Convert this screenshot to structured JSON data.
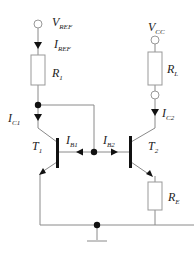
{
  "diagram": {
    "labels": {
      "vref": {
        "main": "V",
        "sub": "REF"
      },
      "iref": {
        "main": "I",
        "sub": "REF"
      },
      "r1": {
        "main": "R",
        "sub": "1"
      },
      "ic1": {
        "main": "I",
        "sub": "C1"
      },
      "ib1": {
        "main": "I",
        "sub": "B1"
      },
      "ib2": {
        "main": "I",
        "sub": "B2"
      },
      "t1": {
        "main": "T",
        "sub": "1"
      },
      "t2": {
        "main": "T",
        "sub": "2"
      },
      "vcc": {
        "main": "V",
        "sub": "CC"
      },
      "rl": {
        "main": "R",
        "sub": "L"
      },
      "ic2": {
        "main": "I",
        "sub": "C2"
      },
      "re": {
        "main": "R",
        "sub": "E"
      }
    },
    "colors": {
      "wire": "#888888",
      "component": "#111111",
      "text": "#222222"
    }
  }
}
